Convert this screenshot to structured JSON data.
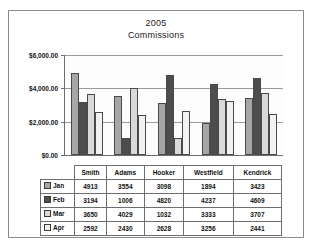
{
  "chart_data": {
    "type": "bar",
    "title": "2005 Commissions",
    "title_lines": [
      "2005",
      "Commissions"
    ],
    "xlabel": "",
    "ylabel": "",
    "ylim": [
      0,
      6000
    ],
    "grid": true,
    "legend_position": "table-below",
    "categories": [
      "Smith",
      "Adams",
      "Hooker",
      "Westfield",
      "Kendrick"
    ],
    "ytick_labels": [
      "$0.00",
      "$2,000.00",
      "$4,000.00",
      "$6,000.00"
    ],
    "ytick_values": [
      0,
      2000,
      4000,
      6000
    ],
    "series": [
      {
        "name": "Jan",
        "color": "#a6a6a6",
        "values": [
          4913,
          3554,
          3098,
          1894,
          3423
        ]
      },
      {
        "name": "Feb",
        "color": "#4d4d4d",
        "values": [
          3194,
          1006,
          4820,
          4237,
          4609
        ]
      },
      {
        "name": "Mar",
        "color": "#d9d9d9",
        "values": [
          3650,
          4029,
          1032,
          3333,
          3707
        ]
      },
      {
        "name": "Apr",
        "color": "#f2f2f2",
        "values": [
          2592,
          2430,
          2628,
          3256,
          2441
        ]
      }
    ]
  },
  "table": {
    "corner_label": "",
    "column_headers": [
      "Smith",
      "Adams",
      "Hooker",
      "Westfield",
      "Kendrick"
    ],
    "rows": [
      {
        "label": "Jan",
        "swatch": "#a6a6a6",
        "values": [
          "4913",
          "3554",
          "3098",
          "1894",
          "3423"
        ]
      },
      {
        "label": "Feb",
        "swatch": "#4d4d4d",
        "values": [
          "3194",
          "1006",
          "4820",
          "4237",
          "4609"
        ]
      },
      {
        "label": "Mar",
        "swatch": "#d9d9d9",
        "values": [
          "3650",
          "4029",
          "1032",
          "3333",
          "3707"
        ]
      },
      {
        "label": "Apr",
        "swatch": "#f2f2f2",
        "values": [
          "2592",
          "2430",
          "2628",
          "3256",
          "2441"
        ]
      }
    ]
  }
}
